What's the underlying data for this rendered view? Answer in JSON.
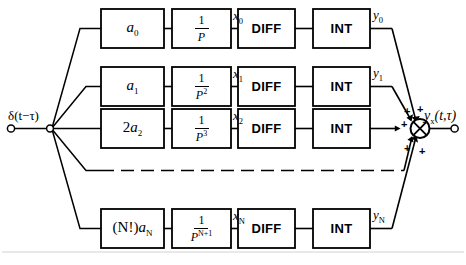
{
  "diagram": {
    "input": {
      "label": "δ(t−τ)",
      "terminal": "open-circle"
    },
    "output": {
      "label_main": "y",
      "label_sub": "x",
      "label_args": "(t,τ)",
      "terminal": "open-circle"
    },
    "summer": {
      "symbol": "circle-with-x",
      "signs": [
        "+",
        "+",
        "+",
        "+"
      ]
    },
    "columns": [
      "gain",
      "operator",
      "diff",
      "int"
    ],
    "rows": [
      {
        "id": "row-0",
        "gain": {
          "coefficient": "",
          "symbol": "a",
          "sub": "0"
        },
        "operator": {
          "numerator": "1",
          "denominator": "P",
          "exp": ""
        },
        "diff_label": "DIFF",
        "int_label": "INT",
        "x_label": "x",
        "x_sub": "0",
        "y_label": "y",
        "y_sub": "0"
      },
      {
        "id": "row-1",
        "gain": {
          "coefficient": "",
          "symbol": "a",
          "sub": "1"
        },
        "operator": {
          "numerator": "1",
          "denominator": "P",
          "exp": "2"
        },
        "diff_label": "DIFF",
        "int_label": "INT",
        "x_label": "x",
        "x_sub": "1",
        "y_label": "y",
        "y_sub": "1"
      },
      {
        "id": "row-2",
        "gain": {
          "coefficient": "2",
          "symbol": "a",
          "sub": "2"
        },
        "operator": {
          "numerator": "1",
          "denominator": "P",
          "exp": "3"
        },
        "diff_label": "DIFF",
        "int_label": "INT",
        "x_label": "x",
        "x_sub": "2",
        "y_label": "y",
        "y_sub": "2"
      },
      {
        "id": "row-ellipsis",
        "style": "dashed",
        "gain": {
          "coefficient": "",
          "symbol": "",
          "sub": ""
        },
        "operator": {
          "numerator": "",
          "denominator": "",
          "exp": ""
        },
        "diff_label": "",
        "int_label": "",
        "x_label": "",
        "x_sub": "",
        "y_label": "",
        "y_sub": ""
      },
      {
        "id": "row-N",
        "gain": {
          "coefficient": "(N!)",
          "symbol": "a",
          "sub": "N"
        },
        "operator": {
          "numerator": "1",
          "denominator": "P",
          "exp": "N+1"
        },
        "diff_label": "DIFF",
        "int_label": "INT",
        "x_label": "x",
        "x_sub": "N",
        "y_label": "y",
        "y_sub": "N"
      }
    ],
    "colors": {
      "line": "#000000",
      "background": "#ffffff",
      "frame": "#cfcfcf"
    }
  }
}
